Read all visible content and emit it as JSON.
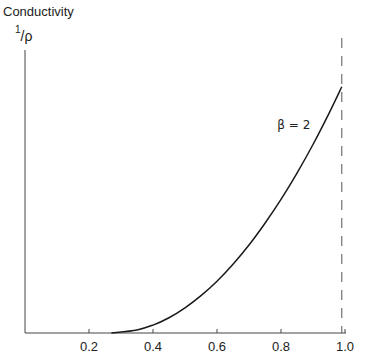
{
  "chart_data": {
    "type": "line",
    "title": "",
    "ylabel": "Conductivity",
    "ylabel_unit_num": "1",
    "ylabel_unit_den": "ρ",
    "xlabel": "",
    "xlim": [
      0,
      1.0
    ],
    "ylim": [
      0,
      1
    ],
    "x_ticks": [
      0.2,
      0.4,
      0.6,
      0.8,
      1.0
    ],
    "x_tick_labels": [
      "0.2",
      "0.4",
      "0.6",
      "0.8",
      "1.0"
    ],
    "y_ticks": [],
    "grid": false,
    "series": [
      {
        "name": "β = 2",
        "style": "solid",
        "x": [
          0.27,
          0.35,
          0.4,
          0.45,
          0.5,
          0.55,
          0.6,
          0.65,
          0.7,
          0.75,
          0.8,
          0.85,
          0.9,
          0.95,
          0.99
        ],
        "y": [
          0.0,
          0.011,
          0.028,
          0.054,
          0.089,
          0.132,
          0.183,
          0.243,
          0.311,
          0.388,
          0.472,
          0.565,
          0.666,
          0.776,
          0.87
        ]
      }
    ],
    "reference_lines": [
      {
        "orientation": "vertical",
        "x": 0.99,
        "style": "dashed"
      }
    ],
    "annotations": [
      {
        "text": "β = 2",
        "x": 0.84,
        "y": 0.72
      }
    ]
  }
}
